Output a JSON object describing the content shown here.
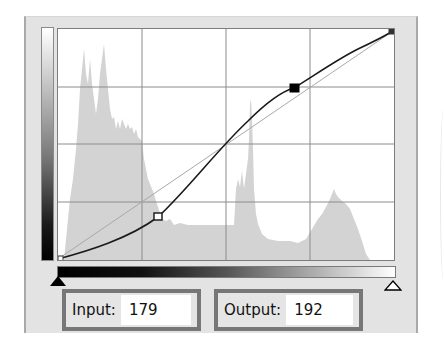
{
  "curves_panel": {
    "input_label": "Input:",
    "input_value": "179",
    "output_label": "Output:",
    "output_value": "192",
    "grid_divisions": 4,
    "control_points": [
      {
        "input": 0,
        "output": 0,
        "style": "endpoint"
      },
      {
        "input": 76,
        "output": 47,
        "style": "hollow"
      },
      {
        "input": 179,
        "output": 192,
        "style": "selected"
      },
      {
        "input": 255,
        "output": 255,
        "style": "endpoint"
      }
    ],
    "black_point_slider": "black-triangle",
    "white_point_slider": "white-triangle",
    "colors": {
      "panel_bg": "#e3e3e3",
      "histogram": "#d4d4d4",
      "grid": "#8c8c8c",
      "curve": "#1a1a1a",
      "diagonal": "#b0b0b0",
      "field_border": "#777777"
    }
  }
}
